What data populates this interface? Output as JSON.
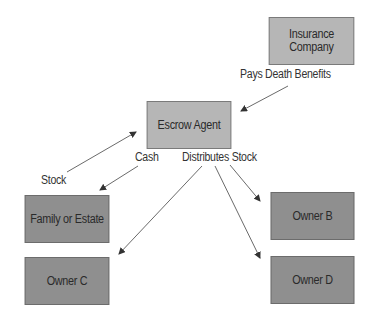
{
  "diagram": {
    "nodes": [
      {
        "id": "insurance",
        "label_line1": "Insurance",
        "label_line2": "Company",
        "shade": "light"
      },
      {
        "id": "escrow",
        "label": "Escrow Agent",
        "shade": "light"
      },
      {
        "id": "family",
        "label": "Family or Estate",
        "shade": "dark"
      },
      {
        "id": "owner_c",
        "label": "Owner C",
        "shade": "dark"
      },
      {
        "id": "owner_b",
        "label": "Owner B",
        "shade": "dark"
      },
      {
        "id": "owner_d",
        "label": "Owner D",
        "shade": "dark"
      }
    ],
    "edge_labels": {
      "pays": "Pays Death Benefits",
      "stock": "Stock",
      "cash": "Cash",
      "distributes": "Distributes Stock"
    },
    "edges": [
      {
        "from": "insurance",
        "to": "escrow",
        "label": "Pays Death Benefits"
      },
      {
        "from": "family",
        "to": "escrow",
        "label": "Stock"
      },
      {
        "from": "escrow",
        "to": "family",
        "label": "Cash"
      },
      {
        "from": "escrow",
        "to": "owner_c",
        "label": "Distributes Stock"
      },
      {
        "from": "escrow",
        "to": "owner_d",
        "label": "Distributes Stock"
      },
      {
        "from": "escrow",
        "to": "owner_b",
        "label": "Distributes Stock"
      }
    ],
    "colors": {
      "light_box": "#b6b6b6",
      "dark_box": "#8f8f8f",
      "arrow": "#333333"
    }
  }
}
